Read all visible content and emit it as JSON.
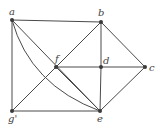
{
  "diagram": {
    "type": "graph",
    "nodes": [
      {
        "id": "a",
        "label": "a",
        "x": 12,
        "y": 20,
        "lx": 9,
        "ly": 15
      },
      {
        "id": "b",
        "label": "b",
        "x": 101,
        "y": 22,
        "lx": 98,
        "ly": 16
      },
      {
        "id": "c",
        "label": "c",
        "x": 145,
        "y": 67,
        "lx": 149,
        "ly": 71
      },
      {
        "id": "d",
        "label": "d",
        "x": 101,
        "y": 67,
        "lx": 103,
        "ly": 64
      },
      {
        "id": "e",
        "label": "e",
        "x": 100,
        "y": 111,
        "lx": 97,
        "ly": 122
      },
      {
        "id": "f",
        "label": "f",
        "x": 56,
        "y": 67,
        "lx": 55,
        "ly": 62
      },
      {
        "id": "g",
        "label": "g'",
        "x": 12,
        "y": 111,
        "lx": 8,
        "ly": 122
      }
    ],
    "edges": [
      [
        "a",
        "b"
      ],
      [
        "a",
        "g"
      ],
      [
        "a",
        "e"
      ],
      [
        "b",
        "g"
      ],
      [
        "b",
        "d"
      ],
      [
        "b",
        "c"
      ],
      [
        "f",
        "d"
      ],
      [
        "d",
        "c"
      ],
      [
        "d",
        "e"
      ],
      [
        "c",
        "e"
      ],
      [
        "g",
        "e"
      ],
      [
        "f",
        "e"
      ]
    ],
    "curved_edges": [
      {
        "from": "a",
        "to": "e",
        "control": [
          30,
          85
        ]
      }
    ]
  }
}
